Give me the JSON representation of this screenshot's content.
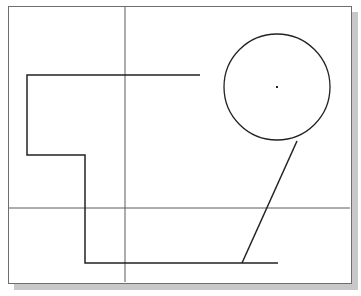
{
  "drawing": {
    "frame": {
      "x": 8,
      "y": 6,
      "w": 343,
      "h": 277,
      "border_color": "#6e6e6e",
      "shadow_color": "#c8c8c8"
    },
    "crosshair": {
      "x": 125,
      "y": 208,
      "color": "#5a5a5a"
    },
    "polyline": {
      "points": [
        [
          200,
          75
        ],
        [
          27,
          75
        ],
        [
          27,
          155
        ],
        [
          85,
          155
        ],
        [
          85,
          263
        ],
        [
          278,
          263
        ]
      ],
      "color": "#222222"
    },
    "circle": {
      "cx": 277,
      "cy": 87,
      "r": 53,
      "color": "#222222"
    },
    "center_point": {
      "x": 277,
      "y": 87
    },
    "tangent_line": {
      "x1": 297,
      "y1": 141,
      "x2": 242,
      "y2": 263,
      "color": "#222222"
    }
  }
}
